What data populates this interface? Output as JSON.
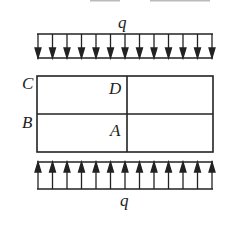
{
  "figure": {
    "type": "structural mechanics diagram",
    "top_load": {
      "label": "q",
      "direction": "down",
      "arrow_count": 13
    },
    "bottom_load": {
      "label": "q",
      "direction": "up",
      "arrow_count": 13
    },
    "plate": {
      "points": [
        {
          "label": "C",
          "position": "top-left corner (outside)"
        },
        {
          "label": "B",
          "position": "left edge midpoint (outside)"
        },
        {
          "label": "D",
          "position": "top center (inside, left of divider)"
        },
        {
          "label": "A",
          "position": "center (inside, left of divider)"
        }
      ],
      "grid": {
        "rows": 2,
        "cols": 2
      }
    },
    "colors": {
      "stroke": "#222222",
      "background": "#ffffff"
    }
  }
}
